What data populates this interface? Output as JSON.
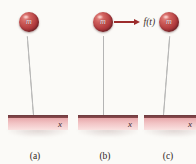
{
  "figure": {
    "background_color": "#fbfaf7",
    "ball_color": "#b03a3d",
    "base_color": "#e8a8ab",
    "base_edge_color": "#6b3a3f",
    "rod_color": "#9a9a9a",
    "force_color": "#9c2c2c"
  },
  "panels": [
    {
      "id": "a",
      "caption": "(a)",
      "mass_label": "m",
      "axis_label": "x",
      "rod_tilt_deg": -4.5,
      "has_force": false,
      "force_label": ""
    },
    {
      "id": "b",
      "caption": "(b)",
      "mass_label": "m",
      "axis_label": "x",
      "rod_tilt_deg": 0,
      "has_force": true,
      "force_label": "f(t)"
    },
    {
      "id": "c",
      "caption": "(c)",
      "mass_label": "m",
      "axis_label": "x",
      "rod_tilt_deg": 4.5,
      "has_force": false,
      "force_label": ""
    }
  ]
}
